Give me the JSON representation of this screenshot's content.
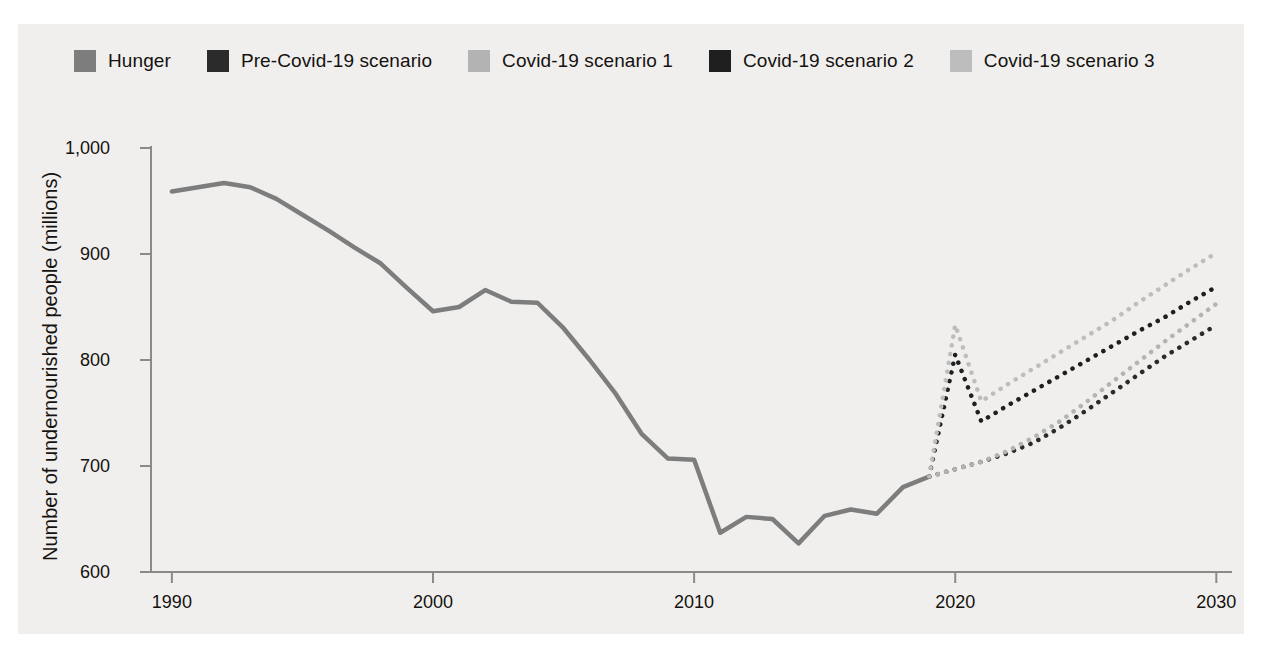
{
  "figure": {
    "title_fragment": "",
    "background": "#f0efee"
  },
  "legend": {
    "position": "top-left",
    "items": [
      {
        "label": "Hunger",
        "color": "#7d7d7d",
        "style": "solid",
        "swatch": "legend-swatch-hunger"
      },
      {
        "label": "Pre-Covid-19 scenario",
        "color": "#2b2b2b",
        "style": "dotted",
        "swatch": "legend-swatch-precovid"
      },
      {
        "label": "Covid-19 scenario 1",
        "color": "#b3b3b3",
        "style": "dotted",
        "swatch": "legend-swatch-covid1"
      },
      {
        "label": "Covid-19 scenario 2",
        "color": "#1f1f1f",
        "style": "dotted",
        "swatch": "legend-swatch-covid2"
      },
      {
        "label": "Covid-19 scenario 3",
        "color": "#bdbdbd",
        "style": "dotted",
        "swatch": "legend-swatch-covid3"
      }
    ]
  },
  "axes": {
    "ylabel": "Number of undernourished people (millions)",
    "xlabel": "",
    "yticks": [
      600,
      700,
      800,
      900,
      1000
    ],
    "ytick_labels": [
      "600",
      "700",
      "800",
      "900",
      "1,000"
    ],
    "xticks": [
      1990,
      2000,
      2010,
      2020,
      2030
    ],
    "xtick_labels": [
      "1990",
      "2000",
      "2010",
      "2020",
      "2030"
    ],
    "ylim": [
      588,
      1010
    ],
    "xlim": [
      1989.2,
      2030.6
    ],
    "grid": false,
    "axis_color": "#8a8a8a"
  },
  "chart_data": {
    "type": "line",
    "title": "Number of undernourished people (millions)",
    "xlabel": "",
    "ylabel": "Number of undernourished people (millions)",
    "xlim": [
      1989.2,
      2030.6
    ],
    "ylim": [
      588,
      1010
    ],
    "grid": false,
    "legend_position": "top-left",
    "series": [
      {
        "name": "Hunger",
        "color": "#7d7d7d",
        "style": "solid",
        "linewidth": 4.5,
        "x": [
          1990,
          1991,
          1992,
          1993,
          1994,
          1995,
          1996,
          1997,
          1998,
          1999,
          2000,
          2001,
          2002,
          2003,
          2004,
          2005,
          2006,
          2007,
          2008,
          2009,
          2010,
          2011,
          2012,
          2013,
          2014,
          2015,
          2016,
          2017,
          2018,
          2019
        ],
        "y": [
          959,
          963,
          967,
          963,
          952,
          937,
          922,
          906,
          891,
          868,
          846,
          850,
          866,
          855,
          854,
          830,
          800,
          768,
          730,
          707,
          706,
          637,
          652,
          650,
          627,
          653,
          659,
          655,
          680,
          690
        ]
      },
      {
        "name": "Pre-Covid-19 scenario",
        "color": "#2b2b2b",
        "style": "dotted",
        "linewidth": 4.5,
        "x": [
          2019,
          2020,
          2021,
          2022,
          2023,
          2024,
          2025,
          2026,
          2027,
          2028,
          2029,
          2030
        ],
        "y": [
          690,
          697,
          704,
          712,
          722,
          736,
          752,
          769,
          786,
          803,
          818,
          833
        ]
      },
      {
        "name": "Covid-19 scenario 1",
        "color": "#b3b3b3",
        "style": "dotted",
        "linewidth": 4.5,
        "x": [
          2019,
          2020,
          2021,
          2022,
          2023,
          2024,
          2025,
          2026,
          2027,
          2028,
          2029,
          2030
        ],
        "y": [
          690,
          697,
          704,
          714,
          727,
          742,
          760,
          779,
          798,
          817,
          835,
          853
        ]
      },
      {
        "name": "Covid-19 scenario 2",
        "color": "#1f1f1f",
        "style": "dotted",
        "linewidth": 4.5,
        "x": [
          2019,
          2020,
          2021,
          2022,
          2023,
          2024,
          2025,
          2026,
          2027,
          2028,
          2029,
          2030
        ],
        "y": [
          690,
          805,
          742,
          757,
          771,
          785,
          799,
          813,
          827,
          840,
          855,
          869
        ]
      },
      {
        "name": "Covid-19 scenario 3",
        "color": "#bdbdbd",
        "style": "dotted",
        "linewidth": 4.5,
        "x": [
          2019,
          2020,
          2021,
          2022,
          2023,
          2024,
          2025,
          2026,
          2027,
          2028,
          2029,
          2030
        ],
        "y": [
          690,
          833,
          761,
          777,
          792,
          807,
          822,
          837,
          854,
          870,
          886,
          901
        ]
      }
    ]
  }
}
